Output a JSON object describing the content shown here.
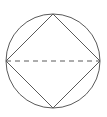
{
  "diagram": {
    "stroke_color": "#5a5a5a",
    "background": "#ffffff",
    "circle": {
      "cx": 53,
      "cy": 61,
      "r": 47
    },
    "square_vertices": [
      {
        "name": "top",
        "x": 53,
        "y": 14
      },
      {
        "name": "right",
        "x": 100,
        "y": 61
      },
      {
        "name": "bottom",
        "x": 53,
        "y": 108
      },
      {
        "name": "left",
        "x": 6,
        "y": 61
      }
    ],
    "dashed_diameter": {
      "x1": 6,
      "y1": 61,
      "x2": 100,
      "y2": 61,
      "dash": "5,4"
    }
  }
}
